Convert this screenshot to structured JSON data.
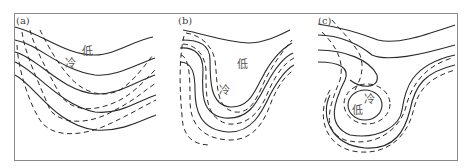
{
  "figure": {
    "panels": [
      {
        "id": "a",
        "label": "(a)",
        "low_label": "低",
        "cold_label": "冷",
        "description": "Open wave: solid contour lines (height) trough, dashed isotherms crossing at angle; cold trough lagging behind height trough"
      },
      {
        "id": "b",
        "label": "(b)",
        "low_label": "低",
        "cold_label": "冷",
        "description": "Deepening trough: solid contours and dashed isotherms become nearly parallel in a deep U-shape"
      },
      {
        "id": "c",
        "label": "(c)",
        "low_label": "低",
        "cold_label": "冷",
        "description": "Cut-off low: closed solid contour and closed dashed isotherm around the cold low center"
      }
    ],
    "legend_implied": {
      "solid_line": "contour (height)",
      "dashed_line": "isotherm (temperature)"
    },
    "colors": {
      "line": "#2a2a2a",
      "frame": "#8a8a8a",
      "text": "#555555",
      "background": "#ffffff"
    }
  }
}
